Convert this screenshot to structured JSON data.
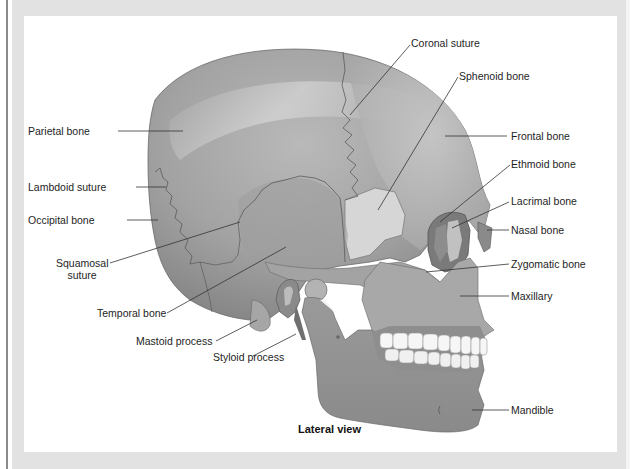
{
  "figure": {
    "caption": "Lateral view",
    "labels": {
      "coronal_suture": "Coronal suture",
      "sphenoid_bone": "Sphenoid bone",
      "parietal_bone": "Parietal bone",
      "frontal_bone": "Frontal bone",
      "ethmoid_bone": "Ethmoid bone",
      "lacrimal_bone": "Lacrimal bone",
      "nasal_bone": "Nasal bone",
      "lambdoid_suture": "Lambdoid suture",
      "occipital_bone": "Occipital bone",
      "squamosal_suture_line1": "Squamosal",
      "squamosal_suture_line2": "suture",
      "zygomatic_bone": "Zygomatic bone",
      "maxillary": "Maxillary",
      "temporal_bone": "Temporal bone",
      "mastoid_process": "Mastoid process",
      "styloid_process": "Styloid process",
      "mandible": "Mandible"
    }
  },
  "colors": {
    "frame": "#e2e2e2",
    "panel": "#ffffff",
    "bone_dark": "#8c8c8c",
    "bone_mid": "#a9a9a9",
    "bone_light": "#c8c8c8",
    "teeth": "#f6f6f6",
    "leader_line": "#333333"
  }
}
